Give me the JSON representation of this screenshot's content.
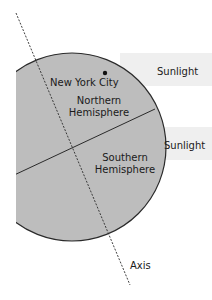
{
  "diagram": {
    "type": "earth-sunlight-diagram",
    "labels": {
      "city": "New York City",
      "northern_line1": "Northern",
      "northern_line2": "Hemisphere",
      "southern_line1": "Southern",
      "southern_line2": "Hemisphere",
      "sunlight_top": "Sunlight",
      "sunlight_bottom": "Sunlight",
      "axis": "Axis"
    },
    "colors": {
      "earth_fill": "#bdbdbd",
      "earth_stroke": "#2a2a2a",
      "sunlight_band": "#efefef",
      "text": "#1a1a1a"
    }
  }
}
